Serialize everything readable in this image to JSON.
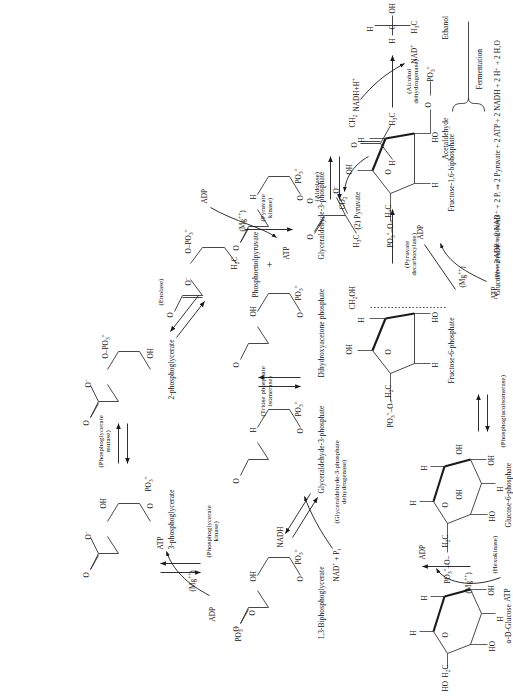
{
  "figure": {
    "orientation": "rotated-90",
    "background": "#ffffff",
    "ink": "#1a1a1a"
  },
  "metabolites": [
    {
      "id": "glucose",
      "label": "α-D-Glucose"
    },
    {
      "id": "g6p",
      "label": "Glucose-6-phosphate"
    },
    {
      "id": "f6p",
      "label": "Fructose-6-phosphate"
    },
    {
      "id": "fbp",
      "label": "Fructose-1,6-biphosphate"
    },
    {
      "id": "g3p1",
      "label": "Glyceraldehyde-3-phosphate"
    },
    {
      "id": "dhap",
      "label": "Dihydroxyacetone phosphate"
    },
    {
      "id": "g3p2",
      "label": "Glyceraldehyde-3-phosphate"
    },
    {
      "id": "bpg",
      "label": "1,3-Biphosphoglycerate"
    },
    {
      "id": "pg3",
      "label": "3-phosphoglycerate"
    },
    {
      "id": "pg2",
      "label": "2-phosphoglycerate"
    },
    {
      "id": "pep",
      "label": "Phosphoenolpyruvate"
    },
    {
      "id": "pyruvate",
      "label": "(2) Pyruvate"
    },
    {
      "id": "acetald",
      "label": "Acetaldehyde"
    },
    {
      "id": "ethanol",
      "label": "Ethanol"
    }
  ],
  "enzymes": [
    {
      "id": "hexokinase",
      "line1": "(Hexokinase)",
      "line2": ""
    },
    {
      "id": "pgi",
      "line1": "(Phosphoglucoisomerase)",
      "line2": ""
    },
    {
      "id": "pfk",
      "line1": "(Phosphofructokinase)",
      "line2": ""
    },
    {
      "id": "aldolase",
      "line1": "(Aldolase)",
      "line2": ""
    },
    {
      "id": "tpi",
      "line1": "(Triose phosphate",
      "line2": "isomerase)"
    },
    {
      "id": "gapdh",
      "line1": "(Glyceraldehyde-3-phosphate",
      "line2": "dehydrogenase)"
    },
    {
      "id": "pgk",
      "line1": "(Phosphoglycerate",
      "line2": "kinase)"
    },
    {
      "id": "pgm",
      "line1": "(Phosphoglycerate",
      "line2": "mutase)"
    },
    {
      "id": "enolase",
      "line1": "(Enolase)",
      "line2": ""
    },
    {
      "id": "pk",
      "line1": "(Pyruvate",
      "line2": "kinase)"
    },
    {
      "id": "pdc",
      "line1": "(Pyruvate",
      "line2": "decarboxylase)"
    },
    {
      "id": "adh",
      "line1": "(Alcohol",
      "line2": "dehydrogenase)"
    }
  ],
  "cofactors": {
    "atp": "ATP",
    "adp": "ADP",
    "mg": "(Mg",
    "mg_charge": "++",
    "mg_close": ")",
    "nad_pi": "NAD",
    "nad_pi_sup": "+",
    "nad_pi_tail": " + P",
    "nad_pi_sub": "i",
    "nadh": "NADH",
    "nad_plus": "NAD",
    "nad_plus_sup": "+",
    "nadh_h": "NADH+H",
    "nadh_h_sup": "+",
    "co2": "CO",
    "co2_sub": "2",
    "plus": "+",
    "pi_free": "PO",
    "pi_free_sub": "3",
    "pi_free_sup": "="
  },
  "groups": {
    "oh": "OH",
    "ho": "HO",
    "h": "H",
    "o": "O",
    "o_minus": "O",
    "h2c": "H",
    "h2c_sub": "2",
    "h2c_tail": "C",
    "h3c": "H",
    "h3c_sub": "3",
    "h3c_tail": "C",
    "ch2oh": "CH",
    "ch2oh_sub": "2",
    "ch2oh_tail": "OH",
    "ch2": "CH",
    "ch2_sub": "2",
    "po3": "PO",
    "po3_sub": "3",
    "po3_sup": "=",
    "c": "C"
  },
  "annotations": {
    "fermentation_bracket": "Fermentation",
    "summary_equation": "Glucose + 2 ADP + 2 NAD⁺ + 2 Pᵢ   ⇒   2 Pyruvate + 2 ATP + 2 NADH + 2 H⁺ + 2 H₂O",
    "cut_off_caption": "… ATP and two NADH …"
  }
}
